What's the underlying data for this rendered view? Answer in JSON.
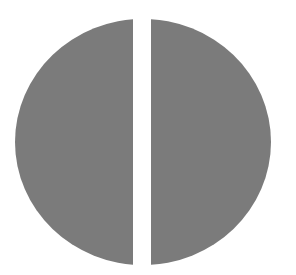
{
  "figure": {
    "fill_color": "#7b7b7b",
    "background_color": "#ffffff",
    "parts": [
      {
        "name": "left-half"
      },
      {
        "name": "right-half"
      }
    ]
  }
}
